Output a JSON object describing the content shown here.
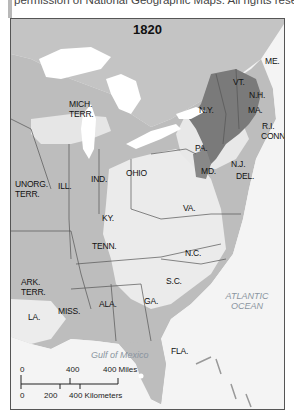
{
  "caption": {
    "text": "permission of National Geographic Maps. All rights reserved."
  },
  "map": {
    "title": "1820",
    "territories": [
      {
        "key": "mich_terr",
        "lines": [
          "MICH.",
          "TERR."
        ]
      },
      {
        "key": "unorg_terr",
        "lines": [
          "UNORG.",
          "TERR."
        ]
      },
      {
        "key": "ark_terr",
        "lines": [
          "ARK.",
          "TERR."
        ]
      }
    ],
    "states": {
      "me": "ME.",
      "vt": "VT.",
      "nh": "N.H.",
      "ny": "N.Y.",
      "ma": "MA.",
      "ri": "R.I.",
      "conn": "CONN.",
      "pa": "PA.",
      "nj": "N.J.",
      "md": "MD.",
      "del": "DEL.",
      "ohio": "OHIO",
      "ind": "IND.",
      "ill": "ILL.",
      "va": "VA.",
      "ky": "KY.",
      "nc": "N.C.",
      "tenn": "TENN.",
      "sc": "S.C.",
      "ga": "GA.",
      "ala": "ALA.",
      "miss": "MISS.",
      "la": "LA.",
      "fla": "FLA."
    },
    "water": {
      "atlantic": [
        "ATLANTIC",
        "OCEAN"
      ],
      "gulf": "Gulf of Mexico"
    },
    "scale": {
      "miles_ticks": [
        "0",
        "400"
      ],
      "miles_label": "400 Miles",
      "km_ticks": [
        "0",
        "200"
      ],
      "km_label": "400 Kilometers"
    },
    "colors": {
      "water": "#f4f4f4",
      "unsettled": "#bdbdbd",
      "light_settlement": "#e9e9e9",
      "dense_settlement": "#7a7a7a",
      "border": "#555555"
    }
  }
}
